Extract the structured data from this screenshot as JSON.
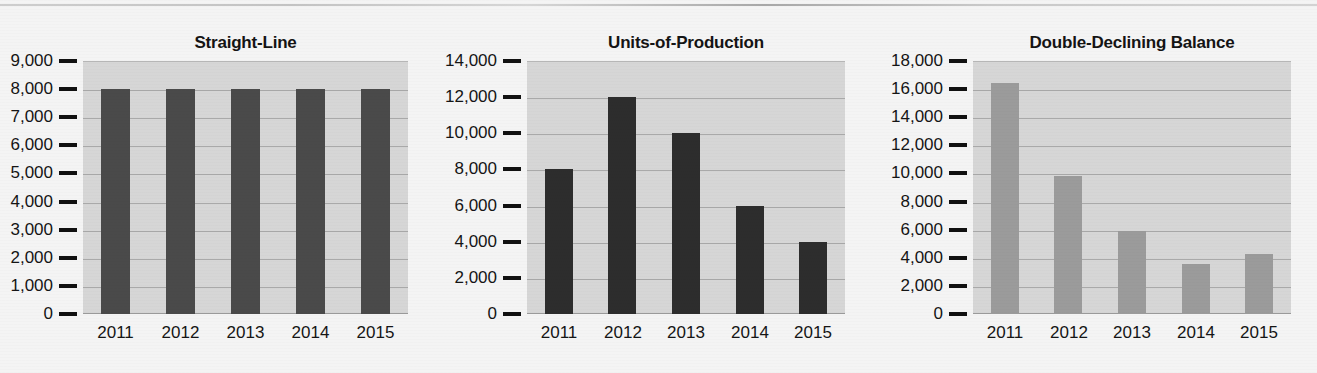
{
  "page": {
    "background_color": "#f4f4f4",
    "top_rule": true,
    "figure_caption": ""
  },
  "charts": [
    {
      "id": "straight-line",
      "title": "Straight-Line",
      "bar_color": "#4a4a4a",
      "plot_color": "#d6d6d6",
      "gridline_color": "#a9a9a9",
      "chart_data": {
        "type": "bar",
        "title": "Straight-Line",
        "categories": [
          "2011",
          "2012",
          "2013",
          "2014",
          "2015"
        ],
        "values": [
          8000,
          8000,
          8000,
          8000,
          8000
        ],
        "xlabel": "",
        "ylabel": "",
        "ylim": [
          0,
          9000
        ],
        "yticks": [
          0,
          1000,
          2000,
          3000,
          4000,
          5000,
          6000,
          7000,
          8000,
          9000
        ],
        "ytick_labels": [
          "0",
          "1,000",
          "2,000",
          "3,000",
          "4,000",
          "5,000",
          "6,000",
          "7,000",
          "8,000",
          "9,000"
        ],
        "grid": true,
        "legend": "none"
      }
    },
    {
      "id": "units-of-production",
      "title": "Units-of-Production",
      "bar_color": "#2d2d2d",
      "plot_color": "#d6d6d6",
      "gridline_color": "#a9a9a9",
      "chart_data": {
        "type": "bar",
        "title": "Units-of-Production",
        "categories": [
          "2011",
          "2012",
          "2013",
          "2014",
          "2015"
        ],
        "values": [
          8000,
          12000,
          10000,
          6000,
          4000
        ],
        "xlabel": "",
        "ylabel": "",
        "ylim": [
          0,
          14000
        ],
        "yticks": [
          0,
          2000,
          4000,
          6000,
          8000,
          10000,
          12000,
          14000
        ],
        "ytick_labels": [
          "0",
          "2,000",
          "4,000",
          "6,000",
          "8,000",
          "10,000",
          "12,000",
          "14,000"
        ],
        "grid": true,
        "legend": "none"
      }
    },
    {
      "id": "double-declining-balance",
      "title": "Double-Declining Balance",
      "bar_color": "#9b9b9b",
      "plot_color": "#d6d6d6",
      "gridline_color": "#a9a9a9",
      "chart_data": {
        "type": "bar",
        "title": "Double-Declining Balance",
        "categories": [
          "2011",
          "2012",
          "2013",
          "2014",
          "2015"
        ],
        "values": [
          16400,
          9840,
          5900,
          3540,
          4260
        ],
        "xlabel": "",
        "ylabel": "",
        "ylim": [
          0,
          18000
        ],
        "yticks": [
          0,
          2000,
          4000,
          6000,
          8000,
          10000,
          12000,
          14000,
          16000,
          18000
        ],
        "ytick_labels": [
          "0",
          "2,000",
          "4,000",
          "6,000",
          "8,000",
          "10,000",
          "12,000",
          "14,000",
          "16,000",
          "18,000"
        ],
        "grid": true,
        "legend": "none"
      }
    }
  ]
}
